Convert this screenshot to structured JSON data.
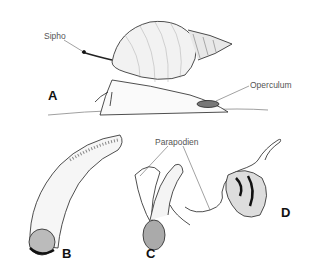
{
  "figure": {
    "labels": {
      "sipho": "Sipho",
      "operculum": "Operculum",
      "parapodien": "Parapodien"
    },
    "panels": [
      "A",
      "B",
      "C",
      "D"
    ]
  }
}
